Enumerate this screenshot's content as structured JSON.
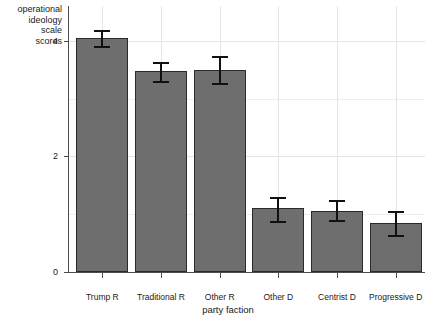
{
  "chart_data": {
    "type": "bar",
    "title": "",
    "xlabel": "party faction",
    "ylabel": "operational ideology scale scores",
    "categories": [
      "Trump R",
      "Traditional R",
      "Other R",
      "Other D",
      "Centrist D",
      "Progressive D"
    ],
    "values": [
      4.04,
      3.48,
      3.5,
      1.1,
      1.06,
      0.85
    ],
    "error_low": [
      3.9,
      3.3,
      3.26,
      0.88,
      0.9,
      0.64
    ],
    "error_high": [
      4.18,
      3.64,
      3.74,
      1.3,
      1.24,
      1.06
    ],
    "ylim": [
      0,
      4.6
    ],
    "yticks": [
      0,
      2,
      4
    ],
    "ytick_labels": [
      "0",
      "2",
      "4"
    ],
    "minor_gridlines": [
      1,
      3
    ],
    "grid": true,
    "legend": "none",
    "bar_color": "#6e6e6e",
    "bar_edge_color": "#2b2b2b",
    "error_bar_color": "#111111",
    "grid_color": "#ededed",
    "axis_color": "#4d4d4d",
    "background_color": "#ffffff"
  },
  "axes": {
    "y_title": "operational\nideology\nscale\nscores",
    "x_title": "party faction"
  }
}
